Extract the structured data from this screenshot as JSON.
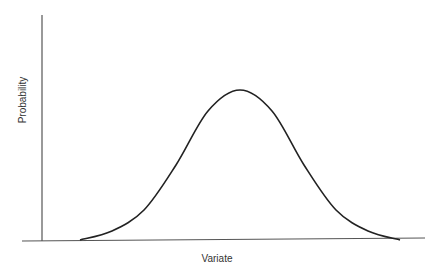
{
  "chart_data": {
    "type": "line",
    "title": "",
    "xlabel": "Variate",
    "ylabel": "Probability",
    "grid": false,
    "legend": null,
    "x": [
      0,
      0.1,
      0.2,
      0.3,
      0.4,
      0.5,
      0.6,
      0.7,
      0.8,
      0.9,
      1.0
    ],
    "values": [
      0.0,
      0.06,
      0.2,
      0.5,
      0.86,
      1.0,
      0.86,
      0.5,
      0.2,
      0.06,
      0.0
    ],
    "xlim": [
      0,
      1
    ],
    "ylim": [
      0,
      1.6
    ]
  },
  "colors": {
    "line": "#222222",
    "axis": "#555555",
    "background": "#ffffff"
  }
}
